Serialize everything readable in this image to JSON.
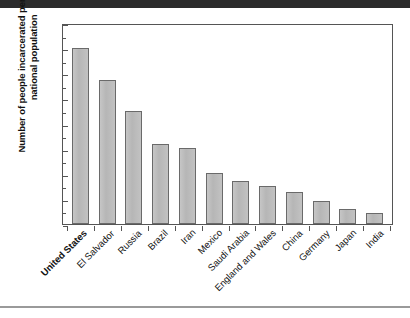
{
  "chart_data": {
    "type": "bar",
    "title": "",
    "xlabel": "",
    "ylabel": "Number of people incarcerated per 100,000 national population",
    "ylim": [
      0,
      800
    ],
    "ytick_values": [
      0,
      100,
      200,
      300,
      400,
      500,
      600,
      700,
      800
    ],
    "ytick_labels": [
      "0",
      "100",
      "200",
      "300",
      "400",
      "500",
      "600",
      "700",
      "800"
    ],
    "yminor_step": 50,
    "grid": false,
    "legend": null,
    "bar_fill_color": "#bcbcbc",
    "bar_edge_color": "#6a6a6a",
    "categories": [
      "United States",
      "El Salvador",
      "Russia",
      "Brazil",
      "Iran",
      "Mexico",
      "Saudi Arabia",
      "England and Wales",
      "China",
      "Germany",
      "Japan",
      "India"
    ],
    "highlighted_categories": [
      "United States"
    ],
    "values": [
      700,
      575,
      450,
      320,
      302,
      205,
      172,
      150,
      128,
      90,
      58,
      42
    ]
  }
}
